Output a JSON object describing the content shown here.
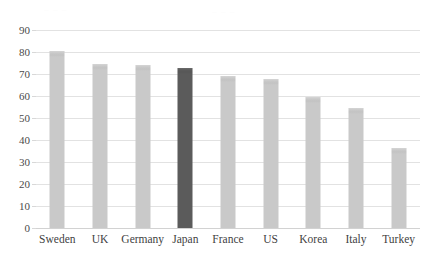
{
  "artifacts": {
    "left_smudge": "~ ~ ~",
    "right_smudge": "~ ~ ~"
  },
  "chart_data": {
    "type": "bar",
    "title": "",
    "subtitle": "",
    "xlabel": "",
    "ylabel": "",
    "categories": [
      "Sweden",
      "UK",
      "Germany",
      "Japan",
      "France",
      "US",
      "Korea",
      "Italy",
      "Turkey"
    ],
    "values": [
      80.5,
      74.4,
      74.0,
      72.8,
      69.3,
      67.6,
      59.4,
      54.6,
      36.3
    ],
    "ylim": [
      0,
      90
    ],
    "ytick_step": 10,
    "yticks": [
      "90",
      "80",
      "70",
      "60",
      "50",
      "40",
      "30",
      "20",
      "10",
      "0"
    ],
    "ytick_values": [
      90,
      80,
      70,
      60,
      50,
      40,
      30,
      20,
      10,
      0
    ],
    "grid": true,
    "legend": "none",
    "highlight_category": "Japan",
    "colors": {
      "bar": "#c9c9c9",
      "bar_highlight": "#5b5b5b",
      "gridline": "#e2e2e2",
      "baseline": "#d2d2d2",
      "text": "#3f3f3f",
      "background": "#ffffff"
    }
  }
}
